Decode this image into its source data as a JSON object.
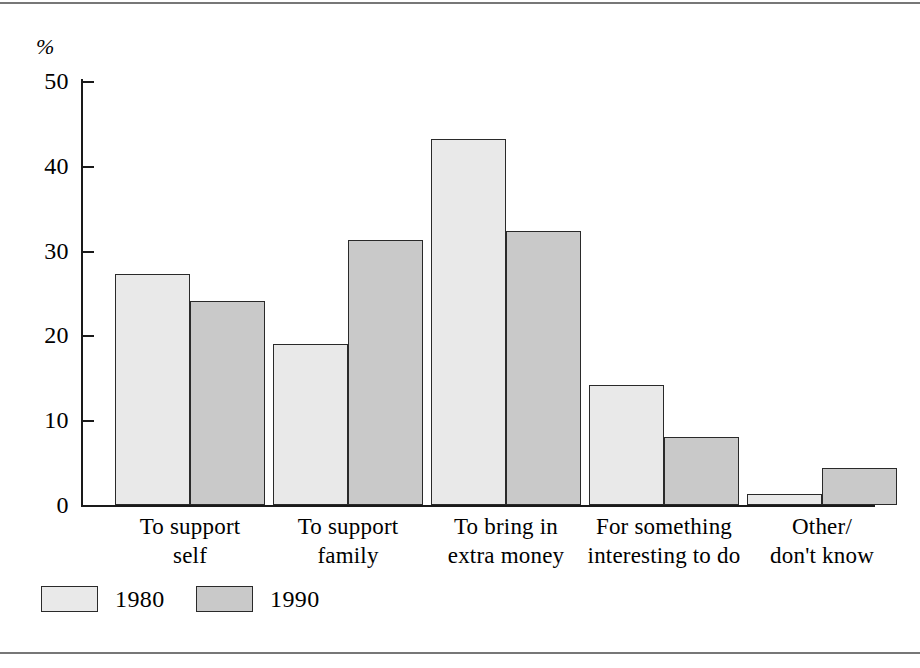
{
  "chart_data": {
    "type": "bar",
    "title": "",
    "subtitle": "",
    "xlabel": "",
    "ylabel": "%",
    "ylim": [
      0,
      50
    ],
    "yticks": [
      0,
      10,
      20,
      30,
      40,
      50
    ],
    "ytick_labels": [
      "0",
      "10",
      "20",
      "30",
      "40",
      "50"
    ],
    "grid": false,
    "legend_position": "bottom-left",
    "categories": [
      "To support\nself",
      "To support\nfamily",
      "To bring in\nextra money",
      "For something\ninteresting to do",
      "Other/\ndon't know"
    ],
    "series": [
      {
        "name": "1980",
        "color": "#e9e9e9",
        "values": [
          27.3,
          19.0,
          43.2,
          14.2,
          1.3
        ]
      },
      {
        "name": "1990",
        "color": "#c9c9c9",
        "values": [
          24.0,
          31.3,
          32.3,
          8.0,
          4.4
        ]
      }
    ]
  },
  "legend": {
    "items": [
      {
        "label": "1980",
        "swatch": "legend-swatch-1980"
      },
      {
        "label": "1990",
        "swatch": "legend-swatch-1990"
      }
    ]
  },
  "axis": {
    "unit_label": "%"
  }
}
